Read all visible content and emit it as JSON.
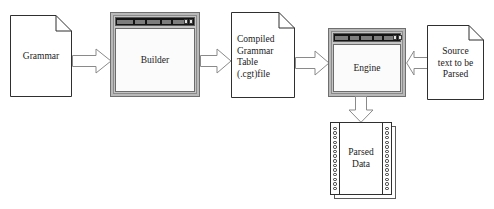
{
  "diagram": {
    "background": "#ffffff",
    "outline_color": "#2f2f2f",
    "window_frame_color": "#b9b9b9",
    "titlebar_color": "#141414"
  },
  "nodes": {
    "grammar_doc": {
      "label": "Grammar",
      "shape": "document",
      "x": 10,
      "y": 15,
      "width": 62,
      "height": 82
    },
    "builder_window": {
      "label": "Builder",
      "shape": "application-window",
      "x": 110,
      "y": 12,
      "width": 90,
      "height": 85
    },
    "cgt_doc": {
      "label": "Compiled\nGrammar\nTable\n(.cgt)file",
      "lines": [
        "Compiled",
        "Grammar",
        "Table",
        "(.cgt)file"
      ],
      "shape": "document",
      "x": 231,
      "y": 12,
      "width": 64,
      "height": 86
    },
    "engine_window": {
      "label": "Engine",
      "shape": "application-window",
      "x": 328,
      "y": 28,
      "width": 78,
      "height": 69
    },
    "source_doc": {
      "label": "Source\ntext to be\nParsed",
      "lines": [
        "Source",
        "text to be",
        "Parsed"
      ],
      "shape": "document",
      "x": 427,
      "y": 25,
      "width": 57,
      "height": 75
    },
    "parsed_data": {
      "label": "Parsed\nData",
      "lines": [
        "Parsed",
        "Data"
      ],
      "shape": "tractor-feed-paper",
      "x": 330,
      "y": 122,
      "width": 62,
      "height": 73,
      "hole_count": 14
    }
  },
  "arrows": [
    {
      "name": "grammar-to-builder",
      "from": "grammar_doc",
      "to": "builder_window",
      "direction": "right"
    },
    {
      "name": "builder-to-cgt",
      "from": "builder_window",
      "to": "cgt_doc",
      "direction": "right"
    },
    {
      "name": "cgt-to-engine",
      "from": "cgt_doc",
      "to": "engine_window",
      "direction": "right"
    },
    {
      "name": "source-to-engine",
      "from": "source_doc",
      "to": "engine_window",
      "direction": "left"
    },
    {
      "name": "engine-to-parsed-data",
      "from": "engine_window",
      "to": "parsed_data",
      "direction": "down"
    }
  ]
}
